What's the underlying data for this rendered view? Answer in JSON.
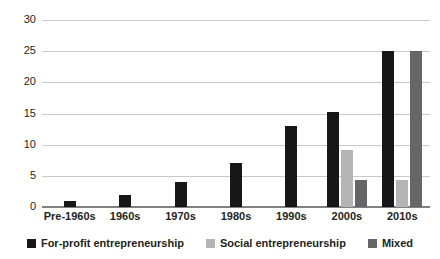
{
  "chart_data": {
    "type": "bar",
    "title": "",
    "subtitle": "",
    "xlabel": "",
    "ylabel": "",
    "ylim": [
      0,
      30
    ],
    "yticks": [
      0,
      5,
      10,
      15,
      20,
      25,
      30
    ],
    "ytick_labels": [
      "0",
      "5",
      "10",
      "15",
      "20",
      "25",
      "30"
    ],
    "grid": true,
    "legend_position": "bottom",
    "categories": [
      "Pre-1960s",
      "1960s",
      "1970s",
      "1980s",
      "1990s",
      "2000s",
      "2010s"
    ],
    "series": [
      {
        "name": "For-profit entrepreneurship",
        "color": "#17171a",
        "values": [
          1,
          2,
          4,
          7,
          13,
          15.3,
          25
        ]
      },
      {
        "name": "Social entrepreneurship",
        "color": "#b4b4b4",
        "values": [
          0,
          0,
          0,
          0,
          0,
          9.2,
          4.3
        ]
      },
      {
        "name": "Mixed",
        "color": "#666668",
        "values": [
          0,
          0,
          0,
          0,
          0,
          4.3,
          25
        ]
      }
    ]
  },
  "colors": {
    "for_profit": "#17171a",
    "social": "#b4b4b4",
    "mixed": "#666668",
    "gridline": "#c9c9c9",
    "axis": "#808080",
    "text": "#231f20",
    "background": "#ffffff"
  }
}
